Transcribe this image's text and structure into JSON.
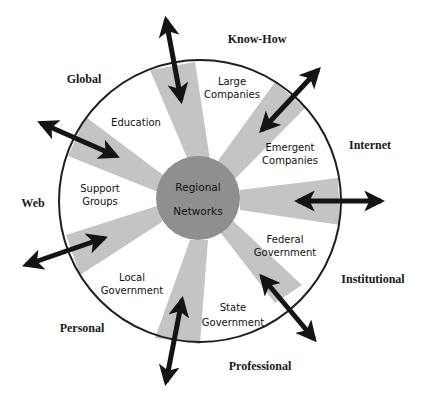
{
  "colors": {
    "spoke": "#c4c4c4",
    "hub": "#8f8f8f",
    "ring": "#1e1e1e",
    "arrow": "#141414",
    "text": "#111111"
  },
  "hub": {
    "line1": "Regional",
    "line2": "Networks"
  },
  "inner_labels": {
    "large_companies": [
      "Large",
      "Companies"
    ],
    "emergent_companies": [
      "Emergent",
      "Companies"
    ],
    "federal_government": [
      "Federal",
      "Government"
    ],
    "state_government": [
      "State",
      "Government"
    ],
    "local_government": [
      "Local",
      "Government"
    ],
    "support_groups": [
      "Support",
      "Groups"
    ],
    "education": [
      "Education"
    ]
  },
  "outer_labels": {
    "know_how": "Know-How",
    "internet": "Internet",
    "institutional": "Institutional",
    "professional": "Professional",
    "personal": "Personal",
    "web": "Web",
    "global": "Global"
  }
}
